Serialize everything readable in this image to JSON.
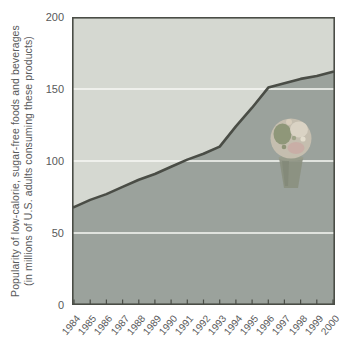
{
  "figure": {
    "y_axis_label_line1": "Popularity of low-calorie, sugar-free foods and beverages",
    "y_axis_label_line2": "(in millions of U.S. adults consuming these products)"
  },
  "chart_data": {
    "type": "area",
    "title": "",
    "xlabel": "",
    "ylabel": "Popularity of low-calorie, sugar-free foods and beverages (in millions of U.S. adults consuming these products)",
    "categories": [
      "1984",
      "1985",
      "1986",
      "1987",
      "1988",
      "1989",
      "1990",
      "1991",
      "1992",
      "1993",
      "1994",
      "1995",
      "1996",
      "1997",
      "1998",
      "1999",
      "2000"
    ],
    "values": [
      68,
      73,
      77,
      82,
      87,
      91,
      96,
      101,
      105,
      110,
      124,
      137,
      151,
      154,
      157,
      159,
      162
    ],
    "ylim": [
      0,
      200
    ],
    "y_ticks": [
      200,
      150,
      100,
      50,
      0
    ],
    "gridlines_y": [
      50,
      100,
      150
    ],
    "legend": null,
    "colors": {
      "background_fill": "#d5d8d1",
      "area_fill": "#9ba29c",
      "line": "#4a4d46",
      "grid": "#f7f8f4",
      "tick_text": "#58595a"
    },
    "annotations": [
      {
        "name": "ice-cream-cone-image",
        "near_category": "1997",
        "description": "clipart of an ice cream cone inside shaded area"
      }
    ]
  }
}
